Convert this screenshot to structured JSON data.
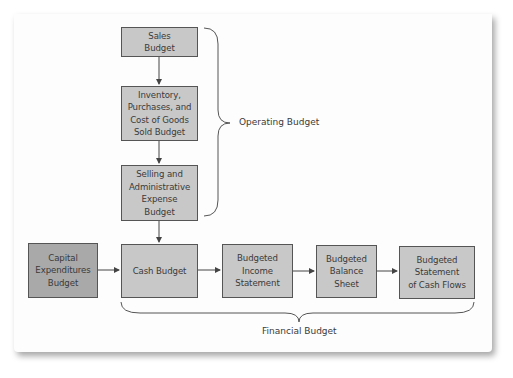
{
  "diagram": {
    "nodes": [
      {
        "id": "sales",
        "label": "Sales\nBudget",
        "group": "operating"
      },
      {
        "id": "inventory",
        "label": "Inventory,\nPurchases, and\nCost of Goods\nSold Budget",
        "group": "operating"
      },
      {
        "id": "selling",
        "label": "Selling and\nAdministrative\nExpense\nBudget",
        "group": "operating"
      },
      {
        "id": "capital",
        "label": "Capital\nExpenditures\nBudget",
        "group": "none"
      },
      {
        "id": "cash",
        "label": "Cash Budget",
        "group": "financial"
      },
      {
        "id": "income",
        "label": "Budgeted\nIncome\nStatement",
        "group": "financial"
      },
      {
        "id": "balance",
        "label": "Budgeted\nBalance\nSheet",
        "group": "financial"
      },
      {
        "id": "cashflows",
        "label": "Budgeted\nStatement\nof Cash Flows",
        "group": "financial"
      }
    ],
    "edges": [
      {
        "from": "sales",
        "to": "inventory"
      },
      {
        "from": "inventory",
        "to": "selling"
      },
      {
        "from": "selling",
        "to": "cash"
      },
      {
        "from": "capital",
        "to": "cash"
      },
      {
        "from": "cash",
        "to": "income"
      },
      {
        "from": "income",
        "to": "balance"
      },
      {
        "from": "balance",
        "to": "cashflows"
      }
    ],
    "groups": {
      "operating_label": "Operating Budget",
      "financial_label": "Financial Budget"
    },
    "colors": {
      "box_fill": "#c8c8c8",
      "capital_box_fill": "#a9a9a9",
      "border": "#555555",
      "text": "#3a3a3a"
    }
  }
}
